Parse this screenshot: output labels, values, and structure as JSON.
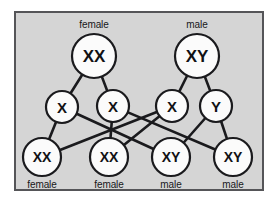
{
  "figure": {
    "panel": {
      "background_color": "#d5d5d5",
      "border_color": "#555558"
    },
    "style": {
      "circle_fill": "#fbfbfb",
      "circle_stroke": "#1a1a1d",
      "line_color": "#1a1a1d",
      "text_color": "#111114"
    }
  },
  "parents": [
    {
      "id": "mother",
      "genotype": "XX",
      "label": "female",
      "label_position": "above",
      "cx": 94,
      "cy": 56,
      "r": 22,
      "text_size": "big"
    },
    {
      "id": "father",
      "genotype": "XY",
      "label": "male",
      "label_position": "above",
      "cx": 197,
      "cy": 56,
      "r": 22,
      "text_size": "big"
    }
  ],
  "gametes": [
    {
      "id": "egg-x1",
      "genotype": "X",
      "cx": 62,
      "cy": 107,
      "r": 16,
      "parent": "mother"
    },
    {
      "id": "egg-x2",
      "genotype": "X",
      "cx": 113,
      "cy": 106,
      "r": 16,
      "parent": "mother"
    },
    {
      "id": "sperm-x",
      "genotype": "X",
      "cx": 172,
      "cy": 106,
      "r": 16,
      "parent": "father"
    },
    {
      "id": "sperm-y",
      "genotype": "Y",
      "cx": 216,
      "cy": 106,
      "r": 16,
      "parent": "father"
    }
  ],
  "offspring": [
    {
      "id": "child-1",
      "genotype": "XX",
      "label": "female",
      "label_position": "below",
      "cx": 42,
      "cy": 157,
      "r": 19,
      "from": [
        "egg-x1",
        "sperm-x"
      ]
    },
    {
      "id": "child-2",
      "genotype": "XX",
      "label": "female",
      "label_position": "below",
      "cx": 109,
      "cy": 157,
      "r": 19,
      "from": [
        "egg-x2",
        "sperm-x"
      ]
    },
    {
      "id": "child-3",
      "genotype": "XY",
      "label": "male",
      "label_position": "below",
      "cx": 171,
      "cy": 157,
      "r": 19,
      "from": [
        "egg-x1",
        "sperm-y"
      ]
    },
    {
      "id": "child-4",
      "genotype": "XY",
      "label": "male",
      "label_position": "below",
      "cx": 233,
      "cy": 157,
      "r": 19,
      "from": [
        "egg-x2",
        "sperm-y"
      ]
    }
  ],
  "connections": [
    {
      "from": "mother",
      "to": "egg-x1"
    },
    {
      "from": "mother",
      "to": "egg-x2"
    },
    {
      "from": "father",
      "to": "sperm-x"
    },
    {
      "from": "father",
      "to": "sperm-y"
    },
    {
      "from": "egg-x1",
      "to": "child-1"
    },
    {
      "from": "egg-x1",
      "to": "child-3"
    },
    {
      "from": "egg-x2",
      "to": "child-2"
    },
    {
      "from": "egg-x2",
      "to": "child-4"
    },
    {
      "from": "sperm-x",
      "to": "child-1"
    },
    {
      "from": "sperm-x",
      "to": "child-2"
    },
    {
      "from": "sperm-y",
      "to": "child-3"
    },
    {
      "from": "sperm-y",
      "to": "child-4"
    }
  ]
}
